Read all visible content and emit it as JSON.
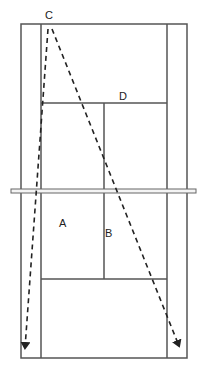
{
  "diagram": {
    "type": "badminton-court",
    "labels": {
      "C": "C",
      "D": "D",
      "A": "A",
      "B": "B"
    },
    "colors": {
      "line": "#555555",
      "arrow": "#222222",
      "background": "#ffffff"
    },
    "arrows": [
      {
        "from": "C",
        "to": "left-back-corner",
        "style": "dashed"
      },
      {
        "from": "C",
        "to": "right-back-corner",
        "style": "dashed"
      }
    ]
  }
}
